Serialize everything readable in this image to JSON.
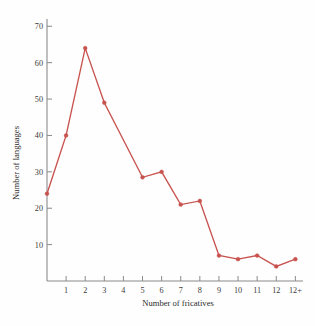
{
  "chart_data": {
    "type": "line",
    "title": "",
    "subtitle": "",
    "xlabel": "Number of fricatives",
    "ylabel": "Number of languages",
    "x": [
      0,
      1,
      2,
      3,
      5,
      6,
      7,
      8,
      9,
      10,
      11,
      12,
      13
    ],
    "xtick_labels": [
      "1",
      "2",
      "3",
      "4",
      "5",
      "6",
      "7",
      "8",
      "9",
      "10",
      "11",
      "12",
      "12+"
    ],
    "xtick_values": [
      1,
      2,
      3,
      4,
      5,
      6,
      7,
      8,
      9,
      10,
      11,
      12,
      13
    ],
    "categories": [
      "0",
      "1",
      "2",
      "3",
      "5",
      "6",
      "7",
      "8",
      "9",
      "10",
      "11",
      "12",
      "12+"
    ],
    "values": [
      24,
      40,
      64,
      49,
      28.5,
      30,
      21,
      22,
      7,
      6,
      7,
      4,
      6
    ],
    "ytick_labels": [
      "10",
      "20",
      "30",
      "40",
      "50",
      "60",
      "70"
    ],
    "ytick_values": [
      10,
      20,
      30,
      40,
      50,
      60,
      70
    ],
    "xlim": [
      0,
      13.4
    ],
    "ylim": [
      0,
      72
    ],
    "grid": false,
    "legend": false,
    "legend_position": "none",
    "series_color": "#c8524e",
    "axis_color": "#8a8a8a",
    "marker": "circle",
    "annotations": []
  },
  "figure": {
    "background_color": "#fefefe",
    "caption": ""
  }
}
